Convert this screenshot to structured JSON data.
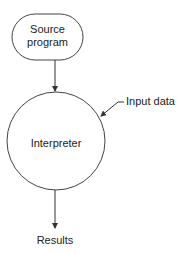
{
  "diagram": {
    "nodes": [
      {
        "id": "source",
        "shape": "rounded-rect",
        "line1": "Source",
        "line2": "program"
      },
      {
        "id": "interpreter",
        "shape": "circle",
        "label": "Interpreter"
      },
      {
        "id": "results",
        "shape": "text",
        "label": "Results"
      }
    ],
    "inputs": {
      "label": "Input data"
    },
    "edges": [
      {
        "from": "source",
        "to": "interpreter"
      },
      {
        "from": "input",
        "to": "interpreter"
      },
      {
        "from": "interpreter",
        "to": "results"
      }
    ],
    "stroke_color": "#333333"
  }
}
